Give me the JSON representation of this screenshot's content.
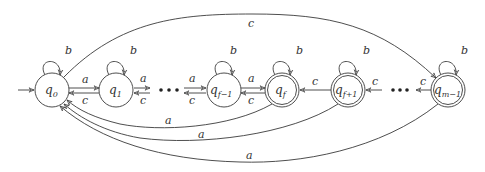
{
  "diagram": {
    "type": "finite-automaton",
    "states": [
      {
        "id": "q0",
        "base": "q",
        "sub": "0",
        "accepting": false,
        "initial": true
      },
      {
        "id": "q1",
        "base": "q",
        "sub": "1",
        "accepting": false,
        "initial": false
      },
      {
        "id": "qf-1",
        "base": "q",
        "sub": "f−1",
        "accepting": false,
        "initial": false
      },
      {
        "id": "qf",
        "base": "q",
        "sub": "f",
        "accepting": true,
        "initial": false
      },
      {
        "id": "qf+1",
        "base": "q",
        "sub": "f+1",
        "accepting": true,
        "initial": false
      },
      {
        "id": "qm-1",
        "base": "q",
        "sub": "m−1",
        "accepting": true,
        "initial": false
      }
    ],
    "ellipsis": "•••",
    "transitions": [
      {
        "from": "q0",
        "to": "q0",
        "label": "b"
      },
      {
        "from": "q1",
        "to": "q1",
        "label": "b"
      },
      {
        "from": "qf-1",
        "to": "qf-1",
        "label": "b"
      },
      {
        "from": "qf",
        "to": "qf",
        "label": "b"
      },
      {
        "from": "qf+1",
        "to": "qf+1",
        "label": "b"
      },
      {
        "from": "qm-1",
        "to": "qm-1",
        "label": "b"
      },
      {
        "from": "q0",
        "to": "q1",
        "label": "a"
      },
      {
        "from": "q1",
        "to": "q0",
        "label": "c"
      },
      {
        "from": "q1",
        "to": "…",
        "label": "a"
      },
      {
        "from": "…",
        "to": "q1",
        "label": "c"
      },
      {
        "from": "…",
        "to": "qf-1",
        "label": "a"
      },
      {
        "from": "qf-1",
        "to": "…",
        "label": "c"
      },
      {
        "from": "qf-1",
        "to": "qf",
        "label": "a"
      },
      {
        "from": "qf",
        "to": "qf-1",
        "label": "c"
      },
      {
        "from": "qf+1",
        "to": "qf",
        "label": "c"
      },
      {
        "from": "…",
        "to": "qf+1",
        "label": "c"
      },
      {
        "from": "qm-1",
        "to": "…",
        "label": "c"
      },
      {
        "from": "q0",
        "to": "qm-1",
        "label": "c"
      },
      {
        "from": "qf",
        "to": "q0",
        "label": "a"
      },
      {
        "from": "qf+1",
        "to": "q0",
        "label": "a"
      },
      {
        "from": "qm-1",
        "to": "q0",
        "label": "a"
      }
    ]
  }
}
